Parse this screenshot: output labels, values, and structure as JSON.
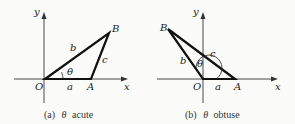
{
  "figures": [
    {
      "id": "a",
      "caption_prefix": "(a)",
      "caption_symbol": "θ",
      "caption_text": "acute",
      "labels": {
        "y": "y",
        "x": "x",
        "O": "O",
        "A": "A",
        "B": "B",
        "a": "a",
        "b": "b",
        "c": "c",
        "theta": "θ"
      }
    },
    {
      "id": "b",
      "caption_prefix": "(b)",
      "caption_symbol": "θ",
      "caption_text": "obtuse",
      "labels": {
        "y": "y",
        "x": "x",
        "O": "O",
        "A": "A",
        "B": "B",
        "a": "a",
        "b": "b",
        "c": "c",
        "theta": "θ"
      }
    }
  ],
  "colors": {
    "line": "#111111",
    "axis": "#333333"
  }
}
